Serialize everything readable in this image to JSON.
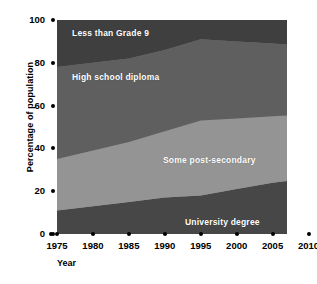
{
  "chart_data": {
    "type": "area",
    "stacked": true,
    "normalized": true,
    "title": "",
    "xlabel": "Year",
    "ylabel": "Percentage of population",
    "xlim": [
      1975,
      2015
    ],
    "ylim": [
      0,
      100
    ],
    "grid": false,
    "legend": "inline-labels",
    "x_tick_labels": [
      "1975",
      "1980",
      "1985",
      "1990",
      "1995",
      "2000",
      "2005",
      "2010",
      "2015"
    ],
    "x_tick_values": [
      1975,
      1980,
      1985,
      1990,
      1995,
      2000,
      2005,
      2010,
      2015
    ],
    "y_tick_labels": [
      "0",
      "20",
      "40",
      "60",
      "80",
      "100"
    ],
    "y_tick_values": [
      0,
      20,
      40,
      60,
      80,
      100
    ],
    "x": [
      1975,
      1980,
      1985,
      1990,
      1995,
      2000,
      2005,
      2010,
      2013
    ],
    "series": [
      {
        "name": "University degree",
        "color": "#474747",
        "label_position": "bottom",
        "values": [
          11,
          13,
          15,
          17,
          18,
          21,
          24,
          26,
          28
        ]
      },
      {
        "name": "Some post-secondary",
        "color": "#949494",
        "label_position": "middle-lower",
        "values": [
          24,
          26,
          28,
          31,
          35,
          33,
          31,
          30,
          29
        ]
      },
      {
        "name": "High school diploma",
        "color": "#5f5f5f",
        "label_position": "middle-upper",
        "values": [
          43,
          41,
          39,
          38,
          38,
          36,
          34,
          32,
          31
        ]
      },
      {
        "name": "Less than Grade 9",
        "color": "#3f3f3f",
        "label_position": "top",
        "values": [
          22,
          20,
          18,
          14,
          9,
          10,
          11,
          12,
          12
        ]
      }
    ],
    "cumulative_upper_bounds": {
      "university_degree": [
        11,
        13,
        15,
        17,
        18,
        21,
        24,
        26,
        28
      ],
      "some_post_secondary": [
        35,
        39,
        43,
        48,
        53,
        54,
        55,
        56,
        57
      ],
      "high_school_diploma": [
        78,
        80,
        82,
        86,
        91,
        90,
        89,
        88,
        88
      ],
      "less_than_grade_9": [
        100,
        100,
        100,
        100,
        100,
        100,
        100,
        100,
        100
      ]
    }
  },
  "axes": {
    "y_title": "Percentage of population",
    "x_title": "Year",
    "y_ticks": [
      {
        "label": "100",
        "value": 100
      },
      {
        "label": "80",
        "value": 80
      },
      {
        "label": "60",
        "value": 60
      },
      {
        "label": "40",
        "value": 40
      },
      {
        "label": "20",
        "value": 20
      },
      {
        "label": "0",
        "value": 0
      }
    ],
    "x_ticks": [
      {
        "label": "1975",
        "value": 1975
      },
      {
        "label": "1980",
        "value": 1980
      },
      {
        "label": "1985",
        "value": 1985
      },
      {
        "label": "1990",
        "value": 1990
      },
      {
        "label": "1995",
        "value": 1995
      },
      {
        "label": "2000",
        "value": 2000
      },
      {
        "label": "2005",
        "value": 2005
      },
      {
        "label": "2010",
        "value": 2010
      },
      {
        "label": "2015",
        "value": 2015
      }
    ]
  },
  "labels": {
    "less_than_grade_9": "Less than Grade 9",
    "high_school_diploma": "High school diploma",
    "some_post_secondary": "Some post-secondary",
    "university_degree": "University degree"
  },
  "colors": {
    "less_than_grade_9": "#3f3f3f",
    "high_school_diploma": "#5f5f5f",
    "some_post_secondary": "#949494",
    "university_degree": "#474747",
    "background": "#ffffff",
    "axis": "#000000",
    "label_text": "#ffffff"
  }
}
